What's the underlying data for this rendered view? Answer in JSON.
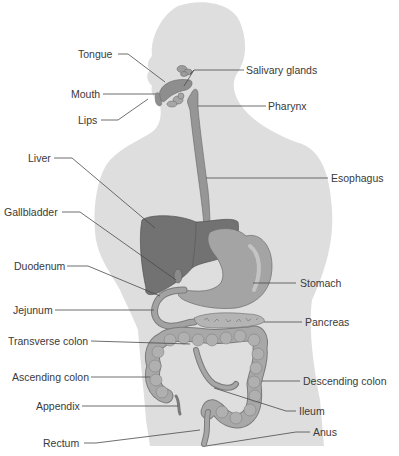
{
  "figure": {
    "colors": {
      "background": "#ffffff",
      "body_silhouette": "#dedede",
      "organ_fill": "#9a9a9a",
      "organ_dark": "#707070",
      "liver_fill": "#727272",
      "stomach_fill": "#a4a4a4",
      "leader_line": "#4a4a4a",
      "label_text": "#3a3a3a"
    }
  },
  "labels": {
    "tongue": "Tongue",
    "mouth": "Mouth",
    "lips": "Lips",
    "salivary_glands": "Salivary glands",
    "pharynx": "Pharynx",
    "liver": "Liver",
    "esophagus": "Esophagus",
    "gallbladder": "Gallbladder",
    "duodenum": "Duodenum",
    "stomach": "Stomach",
    "jejunum": "Jejunum",
    "pancreas": "Pancreas",
    "transverse_colon": "Transverse colon",
    "ascending_colon": "Ascending colon",
    "descending_colon": "Descending colon",
    "appendix": "Appendix",
    "ileum": "Ileum",
    "rectum": "Rectum",
    "anus": "Anus"
  }
}
